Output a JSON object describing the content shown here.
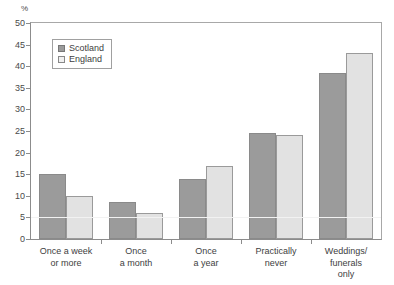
{
  "chart_data": {
    "type": "bar",
    "title": "",
    "xlabel": "",
    "ylabel": "%",
    "ylim": [
      0,
      50
    ],
    "yticks": [
      0,
      5,
      10,
      15,
      20,
      25,
      30,
      35,
      40,
      45,
      50
    ],
    "ytick_labels": [
      "0",
      "5",
      "10",
      "15",
      "20",
      "25",
      "30",
      "35",
      "40",
      "45",
      "50"
    ],
    "grid": false,
    "legend_position": "upper-left",
    "categories": [
      "Once a week\nor more",
      "Once\na month",
      "Once\na year",
      "Practically\nnever",
      "Weddings/\nfunerals\nonly"
    ],
    "category_lines": [
      [
        "Once a week",
        "or more"
      ],
      [
        "Once",
        "a month"
      ],
      [
        "Once",
        "a year"
      ],
      [
        "Practically",
        "never"
      ],
      [
        "Weddings/",
        "funerals",
        "only"
      ]
    ],
    "series": [
      {
        "name": "Scotland",
        "color": "#9b9b9b",
        "values": [
          15,
          8.5,
          14,
          24.5,
          38.5
        ]
      },
      {
        "name": "England",
        "color": "#e2e2e2",
        "values": [
          10,
          6,
          17,
          24,
          43
        ]
      }
    ]
  },
  "legend": {
    "items": [
      {
        "label": "Scotland",
        "swatch": "scotland"
      },
      {
        "label": "England",
        "swatch": "england"
      }
    ]
  },
  "axis": {
    "unit_label": "%"
  }
}
